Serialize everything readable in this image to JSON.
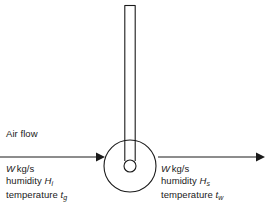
{
  "figure": {
    "kind": "wet-bulb-thermometer-air-flow-diagram",
    "background_color": "#ffffff",
    "stroke_color": "#1a1a1a"
  },
  "labels": {
    "air_flow": "Air flow",
    "inlet": {
      "mass_flow_symbol": "W",
      "mass_flow_units": "kg/s",
      "humidity_word": "humidity",
      "humidity_symbol": "H",
      "humidity_subscript": "i",
      "temperature_word": "temperature",
      "temperature_symbol": "t",
      "temperature_subscript": "g"
    },
    "outlet": {
      "mass_flow_symbol": "W",
      "mass_flow_units": "kg/s",
      "humidity_word": "humidity",
      "humidity_symbol": "H",
      "humidity_subscript": "s",
      "temperature_word": "temperature",
      "temperature_symbol": "t",
      "temperature_subscript": "w"
    }
  },
  "geometry": {
    "tube": {
      "x_left": 124.5,
      "x_right": 135.5,
      "y_top": 5,
      "y_bottom": 161
    },
    "bulb": {
      "cx": 130,
      "cy": 166,
      "r": 26
    },
    "inner_bulb": {
      "cx": 130,
      "cy": 166,
      "r": 6
    },
    "arrow_left": {
      "x_start": 0,
      "x_end": 105,
      "y": 157
    },
    "arrow_right": {
      "x_start": 158,
      "x_end": 265,
      "y": 157
    }
  }
}
